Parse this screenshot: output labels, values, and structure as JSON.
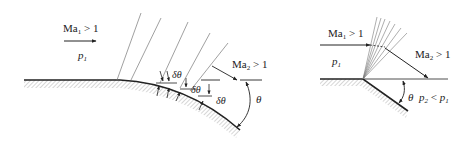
{
  "left_panel": {
    "title": "Continuous turn expansion (curved wall)",
    "upstream_mach": {
      "base": "Ma",
      "sub": "1",
      "rel": " > 1"
    },
    "upstream_pressure": {
      "base": "p",
      "sub": "1"
    },
    "downstream_mach": {
      "base": "Ma",
      "sub": "2",
      "rel": " > 1"
    },
    "increment_labels": [
      "δθ",
      "δθ",
      "δθ"
    ],
    "turn_angle": "θ"
  },
  "right_panel": {
    "title": "Sharp corner expansion fan",
    "upstream_mach": {
      "base": "Ma",
      "sub": "1",
      "rel": " > 1"
    },
    "upstream_pressure": {
      "base": "p",
      "sub": "1"
    },
    "downstream_mach": {
      "base": "Ma",
      "sub": "2",
      "rel": " > 1"
    },
    "turn_angle": "θ",
    "pressure_relation": {
      "p2": "p",
      "p2sub": "2",
      "rel": " < ",
      "p1": "p",
      "p1sub": "1"
    }
  },
  "colors": {
    "line": "#222222",
    "mach_line": "#777777",
    "hatch": "#888888"
  }
}
